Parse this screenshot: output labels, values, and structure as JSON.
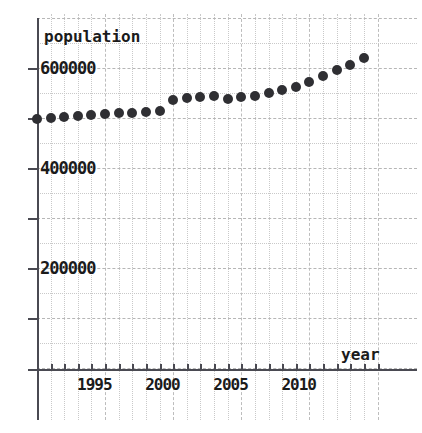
{
  "chart_data": {
    "type": "scatter",
    "title": "",
    "xlabel": "year",
    "ylabel": "population",
    "grid": true,
    "legend": null,
    "xlim": [
      1989.4,
      2015.0
    ],
    "ylim": [
      0,
      740000
    ],
    "x_ticks": [
      1995,
      2000,
      2005,
      2010
    ],
    "x_tick_labels": [
      "1995",
      "2000",
      "2005",
      "2010"
    ],
    "y_ticks": [
      200000,
      400000,
      600000
    ],
    "y_tick_labels": [
      "200000",
      "400000",
      "600000"
    ],
    "x": [
      1990,
      1991,
      1992,
      1993,
      1994,
      1995,
      1996,
      1997,
      1998,
      1999,
      2000,
      2001,
      2002,
      2003,
      2004,
      2005,
      2006,
      2007,
      2008,
      2009,
      2010,
      2011,
      2012,
      2013,
      2014
    ],
    "values": [
      498000,
      500000,
      502000,
      504000,
      506000,
      508000,
      510000,
      511000,
      512000,
      514000,
      536000,
      540000,
      542000,
      544000,
      538000,
      542000,
      544000,
      550000,
      556000,
      562000,
      572000,
      584000,
      596000,
      606000,
      620000
    ],
    "series": [
      {
        "name": "population",
        "values": [
          498000,
          500000,
          502000,
          504000,
          506000,
          508000,
          510000,
          511000,
          512000,
          514000,
          536000,
          540000,
          542000,
          544000,
          538000,
          542000,
          544000,
          550000,
          556000,
          562000,
          572000,
          584000,
          596000,
          606000,
          620000
        ]
      }
    ]
  },
  "axes": {
    "y_axis_title": "population",
    "x_axis_title": "year",
    "y_tick_labels": [
      "600000",
      "400000",
      "200000"
    ],
    "x_tick_labels": [
      "1995",
      "2000",
      "2005",
      "2010"
    ]
  },
  "style": {
    "marker_color": "#2f2f33",
    "axis_color": "#4a4a52",
    "grid_color": "#c9c9c9",
    "text_color": "#1b1b1b",
    "background": "#ffffff"
  }
}
